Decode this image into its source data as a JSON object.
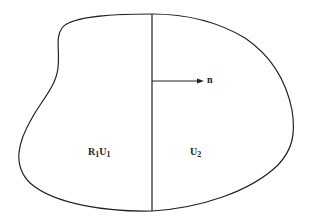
{
  "diagram": {
    "region_left": {
      "symbol": "R",
      "symbol_sub": "1",
      "var": "U",
      "var_sub": "1"
    },
    "region_right": {
      "var": "U",
      "var_sub": "2"
    },
    "normal_label": "n",
    "stroke_color": "#222222",
    "background": "#ffffff"
  }
}
